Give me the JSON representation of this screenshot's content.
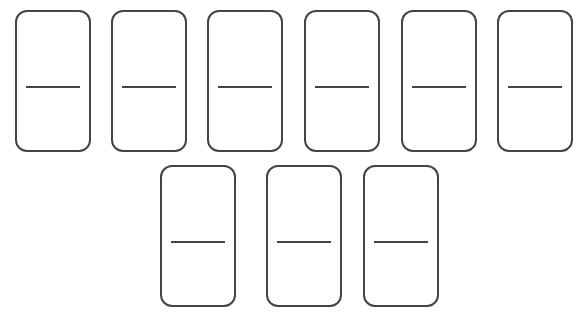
{
  "diagram": {
    "title": "",
    "stroke_color": "#444444",
    "background_color": "#ffffff",
    "rows": [
      {
        "dominoes": [
          {
            "id": 1,
            "top_pips": 0,
            "bottom_pips": 0,
            "x": 15,
            "y": 10
          },
          {
            "id": 2,
            "top_pips": 0,
            "bottom_pips": 0,
            "x": 111,
            "y": 10
          },
          {
            "id": 3,
            "top_pips": 0,
            "bottom_pips": 0,
            "x": 207,
            "y": 10
          },
          {
            "id": 4,
            "top_pips": 0,
            "bottom_pips": 0,
            "x": 304,
            "y": 10
          },
          {
            "id": 5,
            "top_pips": 0,
            "bottom_pips": 0,
            "x": 401,
            "y": 10
          },
          {
            "id": 6,
            "top_pips": 0,
            "bottom_pips": 0,
            "x": 497,
            "y": 10
          }
        ]
      },
      {
        "dominoes": [
          {
            "id": 7,
            "top_pips": 0,
            "bottom_pips": 0,
            "x": 160,
            "y": 165
          },
          {
            "id": 8,
            "top_pips": 0,
            "bottom_pips": 0,
            "x": 266,
            "y": 165
          },
          {
            "id": 9,
            "top_pips": 0,
            "bottom_pips": 0,
            "x": 363,
            "y": 165
          }
        ]
      }
    ]
  }
}
